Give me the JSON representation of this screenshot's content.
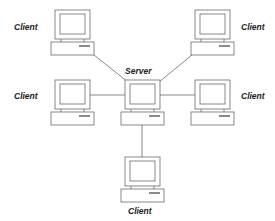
{
  "diagram": {
    "type": "star-network",
    "colors": {
      "stroke": "#6a6a6a",
      "fill": "#ffffff",
      "label": "#222222"
    },
    "hub": {
      "id": "server",
      "label": "Server"
    },
    "nodes": [
      {
        "id": "client-top-left",
        "label": "Client"
      },
      {
        "id": "client-top-right",
        "label": "Client"
      },
      {
        "id": "client-middle-left",
        "label": "Client"
      },
      {
        "id": "client-middle-right",
        "label": "Client"
      },
      {
        "id": "client-bottom",
        "label": "Client"
      }
    ],
    "edges": [
      {
        "from": "server",
        "to": "client-top-left"
      },
      {
        "from": "server",
        "to": "client-top-right"
      },
      {
        "from": "server",
        "to": "client-middle-left"
      },
      {
        "from": "server",
        "to": "client-middle-right"
      },
      {
        "from": "server",
        "to": "client-bottom"
      }
    ]
  }
}
